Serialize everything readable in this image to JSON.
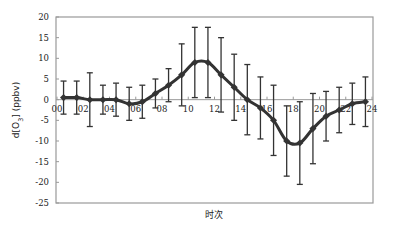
{
  "chart_data": {
    "type": "line",
    "title": "",
    "xlabel": "时次",
    "ylabel": "d[O₃] (ppbv)",
    "ylabel_parts": {
      "prefix": "d[O",
      "sub": "3",
      "suffix": "] (ppbv)"
    },
    "ylim": [
      -25,
      20
    ],
    "xlim": [
      0,
      24
    ],
    "yticks": [
      20,
      15,
      10,
      5,
      0,
      -5,
      -10,
      -15,
      -20,
      -25
    ],
    "xticks": [
      "00",
      "02",
      "04",
      "06",
      "08",
      "10",
      "12",
      "14",
      "16",
      "18",
      "20",
      "22",
      "24"
    ],
    "grid": false,
    "legend": null,
    "error_bars": true,
    "series": [
      {
        "name": "d[O3]",
        "color": "#333333",
        "x": [
          0.5,
          1.5,
          2.5,
          3.5,
          4.5,
          5.5,
          6.5,
          7.5,
          8.5,
          9.5,
          10.5,
          11.5,
          12.5,
          13.5,
          14.5,
          15.5,
          16.5,
          17.5,
          18.5,
          19.5,
          20.5,
          21.5,
          22.5,
          23.5
        ],
        "values": [
          0.5,
          0.5,
          0,
          0,
          0,
          -1,
          -0.5,
          1.5,
          3.5,
          6,
          9,
          9,
          6,
          3,
          0,
          -2,
          -5,
          -10,
          -10.5,
          -7,
          -4,
          -2.5,
          -1,
          -0.5
        ],
        "errors": [
          4,
          4,
          6.5,
          3.5,
          4,
          4,
          4,
          3.5,
          4,
          7.5,
          8.5,
          8.5,
          9,
          8,
          8.5,
          7.5,
          8.5,
          8.5,
          10,
          8.5,
          6,
          5.5,
          5,
          6
        ]
      }
    ]
  }
}
